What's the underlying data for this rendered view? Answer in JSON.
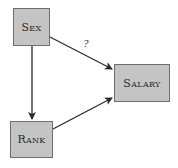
{
  "diagram": {
    "type": "causal-dag",
    "nodes": [
      {
        "id": "sex",
        "label": "Sex",
        "box": {
          "x": 13,
          "y": 8,
          "w": 37,
          "h": 38
        }
      },
      {
        "id": "salary",
        "label": "Salary",
        "box": {
          "x": 114,
          "y": 64,
          "w": 56,
          "h": 38
        }
      },
      {
        "id": "rank",
        "label": "Rank",
        "box": {
          "x": 10,
          "y": 121,
          "w": 43,
          "h": 37
        }
      }
    ],
    "edges": [
      {
        "from": "sex",
        "to": "salary",
        "label": "?"
      },
      {
        "from": "sex",
        "to": "rank",
        "label": ""
      },
      {
        "from": "rank",
        "to": "salary",
        "label": ""
      }
    ],
    "colors": {
      "node_fill": "#c4c4c4",
      "node_border": "#6e6e6e",
      "edge": "#2a2a2a"
    }
  }
}
